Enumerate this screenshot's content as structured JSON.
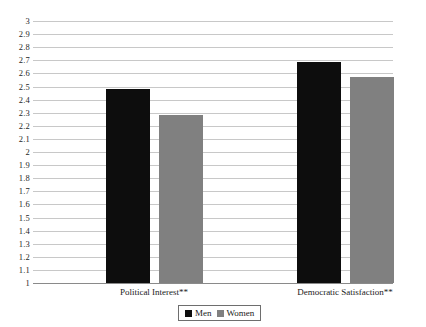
{
  "chart_data": {
    "type": "bar",
    "title": "",
    "subtitle": "",
    "xlabel": "",
    "ylabel": "",
    "categories": [
      "Political Interest**",
      "Democratic Satisfaction**"
    ],
    "series": [
      {
        "name": "Men",
        "color": "#0d0d0d",
        "values": [
          2.48,
          2.69
        ]
      },
      {
        "name": "Women",
        "color": "#808080",
        "values": [
          2.28,
          2.57
        ]
      }
    ],
    "ylim": [
      1,
      3
    ],
    "ytick_step": 0.1,
    "ytick_labels": [
      "3",
      "2.9",
      "2.8",
      "2.7",
      "2.6",
      "2.5",
      "2.4",
      "2.3",
      "2.2",
      "2.1",
      "2",
      "1.9",
      "1.8",
      "1.7",
      "1.6",
      "1.5",
      "1.4",
      "1.3",
      "1.2",
      "1.1",
      "1"
    ],
    "grid": true,
    "legend_position": "bottom-center",
    "legend_entries": [
      "Men",
      "Women"
    ],
    "gridline_color": "#c8c8c8",
    "axis_color": "#8a8a8a",
    "background_color": "#ffffff"
  }
}
